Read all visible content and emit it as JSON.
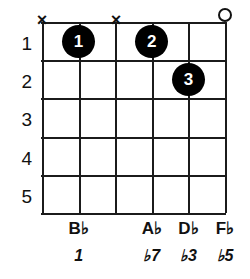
{
  "diagram": {
    "type": "guitar-chord-diagram",
    "strings_count": 6,
    "frets_count": 5,
    "ink_color": "#111111",
    "dot_color": "#000000",
    "dot_text_color": "#ffffff",
    "background_color": "#ffffff"
  },
  "fret_numbers": [
    "1",
    "2",
    "3",
    "4",
    "5"
  ],
  "string_markers": [
    {
      "string": 1,
      "symbol": "×",
      "name": "muted-marker-string-1",
      "type": "muted"
    },
    {
      "string": 3,
      "symbol": "×",
      "name": "muted-marker-string-3",
      "type": "muted"
    },
    {
      "string": 6,
      "symbol": "o",
      "name": "open-marker-string-6",
      "type": "open"
    }
  ],
  "finger_dots": [
    {
      "label": "1",
      "string": 2,
      "fret": 1,
      "name": "finger-dot-1"
    },
    {
      "label": "2",
      "string": 4,
      "fret": 1,
      "name": "finger-dot-2"
    },
    {
      "label": "3",
      "string": 5,
      "fret": 2,
      "name": "finger-dot-3"
    }
  ],
  "note_labels": [
    {
      "string": 1,
      "text": "",
      "root": "",
      "accidental": ""
    },
    {
      "string": 2,
      "text": "B♭",
      "root": "B",
      "accidental": "♭"
    },
    {
      "string": 3,
      "text": "",
      "root": "",
      "accidental": ""
    },
    {
      "string": 4,
      "text": "A♭",
      "root": "A",
      "accidental": "♭"
    },
    {
      "string": 5,
      "text": "D♭",
      "root": "D",
      "accidental": "♭"
    },
    {
      "string": 6,
      "text": "F♭",
      "root": "F",
      "accidental": "♭"
    }
  ],
  "interval_labels": [
    {
      "string": 1,
      "text": "",
      "accidental": "",
      "degree": ""
    },
    {
      "string": 2,
      "text": "1",
      "accidental": "",
      "degree": "1"
    },
    {
      "string": 3,
      "text": "",
      "accidental": "",
      "degree": ""
    },
    {
      "string": 4,
      "text": "♭7",
      "accidental": "♭",
      "degree": "7"
    },
    {
      "string": 5,
      "text": "♭3",
      "accidental": "♭",
      "degree": "3"
    },
    {
      "string": 6,
      "text": "♭5",
      "accidental": "♭",
      "degree": "5"
    }
  ]
}
